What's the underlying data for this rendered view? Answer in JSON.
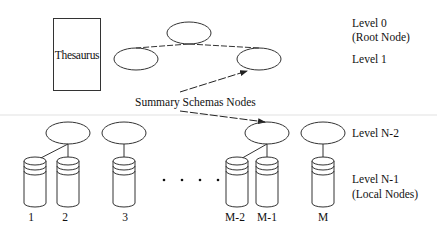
{
  "diagram": {
    "thesaurus_label": "Thesaurus",
    "callout_label": "Summary Schemas Nodes",
    "levels": {
      "level0": "Level 0",
      "level0_sub": "(Root Node)",
      "level1": "Level 1",
      "levelN2": "Level N-2",
      "levelN1": "Level N-1",
      "levelN1_sub": "(Local Nodes)"
    },
    "ellipsis": ". . . .",
    "local_nodes": [
      "1",
      "2",
      "3",
      "M-2",
      "M-1",
      "M"
    ],
    "colors": {
      "stroke": "#333333",
      "text": "#111111",
      "divider": "#f0f0f0"
    }
  }
}
